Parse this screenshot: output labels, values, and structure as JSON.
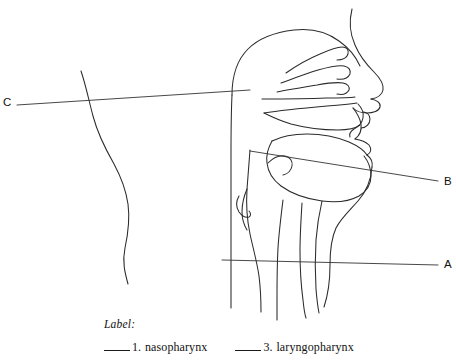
{
  "figure": {
    "kind": "anatomical-line-diagram",
    "line_color": "#2b2b2b",
    "background_color": "#ffffff",
    "callouts": [
      {
        "letter": "C",
        "side": "left",
        "points_to": "upper pharynx region behind nasal cavity"
      },
      {
        "letter": "B",
        "side": "right",
        "points_to": "middle pharynx region behind the oral cavity"
      },
      {
        "letter": "A",
        "side": "right",
        "points_to": "lower pharynx / laryngeal region"
      }
    ]
  },
  "worksheet": {
    "heading": "Label:",
    "answers": [
      {
        "blank": "",
        "number": "1.",
        "term": "nasopharynx"
      },
      {
        "blank": "",
        "number": "3.",
        "term": "laryngopharynx"
      }
    ]
  }
}
